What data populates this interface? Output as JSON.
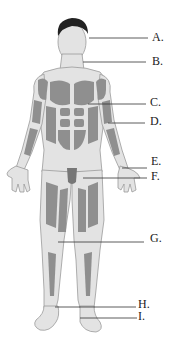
{
  "diagram": {
    "type": "anatomical-figure",
    "colors": {
      "skin": "#e3e3e3",
      "muscle": "#8f8f8f",
      "outline": "#9a9a9a",
      "hair": "#222222",
      "leader_line": "#333333",
      "label_text": "#1a1a1a"
    },
    "labels": [
      {
        "id": "A",
        "text": "A.",
        "x": 152,
        "y": 31,
        "line": {
          "x1": 89,
          "y1": 38,
          "x2": 148,
          "y2": 38
        }
      },
      {
        "id": "B",
        "text": "B.",
        "x": 152,
        "y": 55,
        "line": {
          "x1": 83,
          "y1": 62,
          "x2": 146,
          "y2": 62
        }
      },
      {
        "id": "C",
        "text": "C.",
        "x": 150,
        "y": 96,
        "line": {
          "x1": 88,
          "y1": 104,
          "x2": 146,
          "y2": 104
        }
      },
      {
        "id": "D",
        "text": "D.",
        "x": 150,
        "y": 115,
        "line": {
          "x1": 108,
          "y1": 123,
          "x2": 145,
          "y2": 123
        }
      },
      {
        "id": "E",
        "text": "E.",
        "x": 151,
        "y": 155,
        "line": {
          "x1": 122,
          "y1": 168,
          "x2": 147,
          "y2": 168
        }
      },
      {
        "id": "F",
        "text": "F.",
        "x": 151,
        "y": 170,
        "line": {
          "x1": 83,
          "y1": 178,
          "x2": 147,
          "y2": 178
        }
      },
      {
        "id": "G",
        "text": "G.",
        "x": 150,
        "y": 232,
        "line": {
          "x1": 58,
          "y1": 242,
          "x2": 144,
          "y2": 242
        }
      },
      {
        "id": "H",
        "text": "H.",
        "x": 138,
        "y": 298,
        "line": {
          "x1": 55,
          "y1": 307,
          "x2": 136,
          "y2": 307
        }
      },
      {
        "id": "I",
        "text": "I.",
        "x": 138,
        "y": 310,
        "line": {
          "x1": 80,
          "y1": 318,
          "x2": 137,
          "y2": 318
        }
      }
    ]
  }
}
